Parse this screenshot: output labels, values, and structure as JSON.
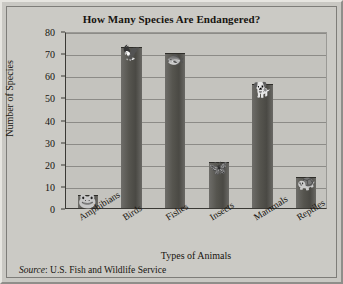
{
  "chart_data": {
    "type": "bar",
    "title": "How Many Species Are Endangered?",
    "xlabel": "Types of Animals",
    "ylabel": "Number of Species",
    "categories": [
      "Amphibians",
      "Birds",
      "Fishes",
      "Insects",
      "Mammals",
      "Reptiles"
    ],
    "values": [
      6,
      73,
      70,
      21,
      56,
      14
    ],
    "icons": [
      "frog-icon",
      "bird-icon",
      "fish-icon",
      "butterfly-icon",
      "mammal-icon",
      "turtle-icon"
    ],
    "ylim": [
      0,
      80
    ],
    "ytick_labels": [
      "0",
      "10",
      "20",
      "30",
      "40",
      "50",
      "60",
      "70",
      "80"
    ],
    "ytick_values": [
      0,
      10,
      20,
      30,
      40,
      50,
      60,
      70,
      80
    ],
    "grid": true,
    "legend": "none",
    "bar_color": "#56554f"
  },
  "footer": {
    "source_word": "Source",
    "source_separator": ": ",
    "source_text": "U.S. Fish and Wildlife Service"
  }
}
